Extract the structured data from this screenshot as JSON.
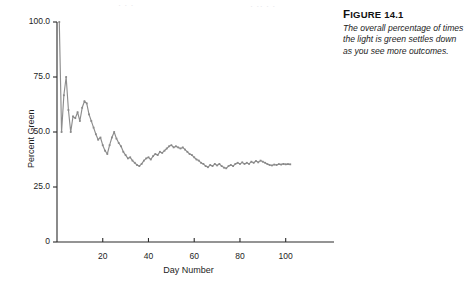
{
  "figure": {
    "label_prefix": "F",
    "label_rest": "IGURE",
    "number": "14.1",
    "caption": "The overall percentage of times the light is green settles down as you see more outcomes."
  },
  "style": {
    "line_color": "#8d8d8d",
    "marker_color": "#8a8a8a",
    "axis_color": "#2b2b2b",
    "text_color": "#1d1d1d",
    "background": "#ffffff"
  },
  "bleed_text": [
    {
      "t": "·  ·      ·",
      "x": 118,
      "y": 1
    },
    {
      "t": "· ·· · ·",
      "x": 250,
      "y": 2
    }
  ],
  "chart_data": {
    "type": "line",
    "title": "",
    "xlabel": "Day Number",
    "ylabel": "Percent Green",
    "xlim": [
      0,
      115
    ],
    "ylim": [
      0,
      104
    ],
    "xticks": [
      20,
      40,
      60,
      80,
      100
    ],
    "yticks": [
      0,
      25,
      50,
      75,
      100
    ],
    "ytick_labels": [
      "0",
      "25.0",
      "50.0",
      "75.0",
      "100.0"
    ],
    "xtick_labels": [
      "20",
      "40",
      "60",
      "80",
      "100"
    ],
    "grid": false,
    "legend": null,
    "markers": true,
    "series": [
      {
        "name": "Percent Green",
        "x": [
          1,
          2,
          3,
          4,
          5,
          6,
          7,
          8,
          9,
          10,
          11,
          12,
          13,
          14,
          15,
          16,
          17,
          18,
          19,
          20,
          21,
          22,
          23,
          24,
          25,
          26,
          27,
          28,
          29,
          30,
          31,
          32,
          33,
          34,
          35,
          36,
          37,
          38,
          39,
          40,
          41,
          42,
          43,
          44,
          45,
          46,
          47,
          48,
          49,
          50,
          51,
          52,
          53,
          54,
          55,
          56,
          57,
          58,
          59,
          60,
          61,
          62,
          63,
          64,
          65,
          66,
          67,
          68,
          69,
          70,
          71,
          72,
          73,
          74,
          75,
          76,
          77,
          78,
          79,
          80,
          81,
          82,
          83,
          84,
          85,
          86,
          87,
          88,
          89,
          90,
          91,
          92,
          93,
          94,
          95,
          96,
          97,
          98,
          99,
          100,
          101,
          102
        ],
        "values": [
          100.0,
          50.0,
          66.7,
          75.0,
          60.0,
          50.0,
          57.1,
          56.3,
          59.0,
          55.0,
          61.0,
          64.0,
          63.0,
          58.0,
          55.0,
          52.0,
          49.0,
          46.5,
          47.5,
          44.0,
          41.5,
          40.0,
          44.0,
          47.5,
          50.0,
          47.0,
          45.0,
          43.5,
          41.0,
          39.5,
          38.0,
          38.5,
          37.0,
          36.0,
          35.0,
          34.5,
          35.5,
          37.0,
          38.0,
          38.5,
          37.5,
          39.0,
          40.0,
          39.5,
          41.0,
          40.5,
          41.5,
          42.5,
          43.5,
          44.0,
          43.0,
          43.5,
          43.0,
          42.5,
          43.0,
          42.0,
          41.0,
          40.0,
          39.5,
          38.5,
          37.5,
          37.0,
          36.0,
          35.5,
          34.5,
          34.0,
          35.0,
          34.5,
          35.5,
          34.8,
          35.5,
          34.5,
          33.8,
          33.5,
          34.5,
          35.0,
          34.5,
          35.5,
          36.0,
          35.5,
          36.2,
          35.5,
          36.0,
          35.5,
          36.5,
          36.0,
          36.8,
          36.2,
          37.0,
          36.5,
          36.0,
          35.4,
          35.0,
          34.8,
          35.2,
          35.0,
          35.4,
          35.2,
          35.5,
          35.3,
          35.4,
          35.3
        ]
      }
    ]
  }
}
